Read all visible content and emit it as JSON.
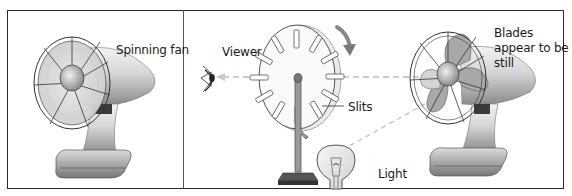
{
  "panels": {
    "left": {
      "title": "Spinning fan panel",
      "labels": {
        "spinning_fan": "Spinning fan"
      }
    },
    "right": {
      "title": "Stroboscope panel",
      "labels": {
        "viewer": "Viewer",
        "slits": "Slits",
        "light": "Light",
        "blades_still": "Blades appear to be still"
      }
    }
  },
  "colors": {
    "frame": "#2a2a2a",
    "metal_light": "#e6e6e6",
    "metal_mid": "#bdbdbd",
    "metal_dark": "#6e6e6e",
    "arrow": "#7a7a7a",
    "dashed_ray": "#bdbdbd"
  },
  "icons": [
    "eye-icon",
    "rotation-arrow-icon",
    "light-bulb-icon",
    "fan-icon",
    "slotted-disc-icon"
  ]
}
